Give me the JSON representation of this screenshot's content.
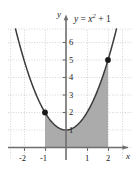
{
  "figure": {
    "equation_label": "y = x2 + 1",
    "equation_parts": {
      "lhs": "y",
      "eq": " = ",
      "base": "x",
      "exponent": "2",
      "tail": " + 1"
    },
    "x_axis_name": "x",
    "y_axis_name": "y"
  },
  "chart_data": {
    "type": "line",
    "title": "",
    "subtitle": "",
    "xlabel": "x",
    "ylabel": "y",
    "annotations": [
      "y = x^2 + 1"
    ],
    "legend": [],
    "legend_position": "none",
    "grid": true,
    "grid_style": "dotted",
    "xlim": [
      -2.7,
      3.1
    ],
    "ylim": [
      -0.6,
      7.2
    ],
    "xticks": [
      -2,
      -1,
      1,
      2
    ],
    "xtick_labels": [
      "-2",
      "-1",
      "1",
      "2"
    ],
    "yticks": [
      1,
      2,
      3,
      4,
      5,
      6
    ],
    "ytick_labels": [
      "1",
      "2",
      "3",
      "4",
      "5",
      "6"
    ],
    "series": [
      {
        "name": "y = x^2 + 1",
        "type": "line",
        "color": "#3b3b3b",
        "function": "y = x^2 + 1",
        "x": [
          -2.45,
          -2.2,
          -2,
          -1.75,
          -1.5,
          -1.25,
          -1,
          -0.75,
          -0.5,
          -0.25,
          0,
          0.25,
          0.5,
          0.75,
          1,
          1.25,
          1.5,
          1.75,
          2,
          2.2,
          2.45
        ],
        "values": [
          7.0,
          5.84,
          5,
          4.06,
          3.25,
          2.56,
          2,
          1.56,
          1.25,
          1.06,
          1,
          1.06,
          1.25,
          1.56,
          2,
          2.56,
          3.25,
          4.06,
          5,
          5.84,
          7.0
        ]
      }
    ],
    "points": [
      {
        "name": "left-endpoint",
        "x": -1,
        "y": 2,
        "color": "#1a1a1a"
      },
      {
        "name": "right-endpoint",
        "x": 2,
        "y": 5,
        "color": "#1a1a1a"
      }
    ],
    "shaded_region": {
      "name": "area-under-curve",
      "x_from": -1,
      "x_to": 2,
      "y_from": 0,
      "upper_boundary": "y = x^2 + 1",
      "fill_color": "#a6a6a6"
    },
    "axis_color": "#6e6e6e",
    "grid_color": "#c9c9c9",
    "curve_color": "#3b3b3b"
  }
}
